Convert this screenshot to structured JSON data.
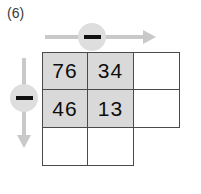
{
  "figure": {
    "label": "(6)",
    "operators": {
      "horizontal": {
        "symbol": "—",
        "name": "minus",
        "direction": "right"
      },
      "vertical": {
        "symbol": "—",
        "name": "minus",
        "direction": "down"
      }
    },
    "colors": {
      "shaded_cell": "#d9d9d9",
      "empty_cell": "#ffffff",
      "grid_line": "#4a4a4a",
      "arrow": "#c9c9c9",
      "badge": "#dedede",
      "glyph": "#111111",
      "text": "#0d0d0d"
    },
    "grid": {
      "rows": [
        {
          "cells": [
            {
              "value": "76",
              "state": "shaded"
            },
            {
              "value": "34",
              "state": "shaded"
            },
            {
              "value": "",
              "state": "blank"
            }
          ]
        },
        {
          "cells": [
            {
              "value": "46",
              "state": "shaded"
            },
            {
              "value": "13",
              "state": "shaded"
            },
            {
              "value": "",
              "state": "blank"
            }
          ]
        },
        {
          "cells": [
            {
              "value": "",
              "state": "blank"
            },
            {
              "value": "",
              "state": "blank"
            },
            {
              "value": "",
              "state": "hidden"
            }
          ]
        }
      ]
    }
  }
}
